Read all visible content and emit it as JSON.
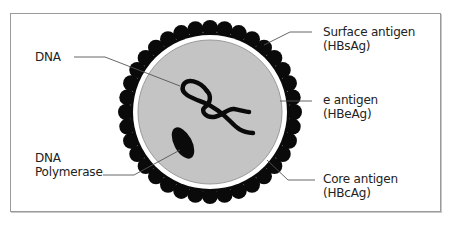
{
  "diagram": {
    "colors": {
      "frame": "#9a9a9a",
      "core_fill": "#c4c4c4",
      "core_stroke": "#8a8a8a",
      "envelope_ring": "#ffffff",
      "beads": "#0a0a0a",
      "dna": "#0a0a0a",
      "leader_lines": "#555555",
      "text": "#222222"
    },
    "labels": {
      "dna": {
        "line1": "DNA"
      },
      "dna_polymerase": {
        "line1": "DNA",
        "line2": "Polymerase"
      },
      "surface_antigen": {
        "line1": "Surface antigen",
        "line2": "(HBsAg)"
      },
      "e_antigen": {
        "line1": "e antigen",
        "line2": "(HBeAg)"
      },
      "core_antigen": {
        "line1": "Core antigen",
        "line2": "(HBcAg)"
      }
    },
    "structure": {
      "center": [
        210,
        112
      ],
      "core_radius": 72,
      "ring_outer_radius": 77,
      "bead_orbit_radius": 84,
      "bead_radius": 8,
      "bead_count": 36
    }
  }
}
